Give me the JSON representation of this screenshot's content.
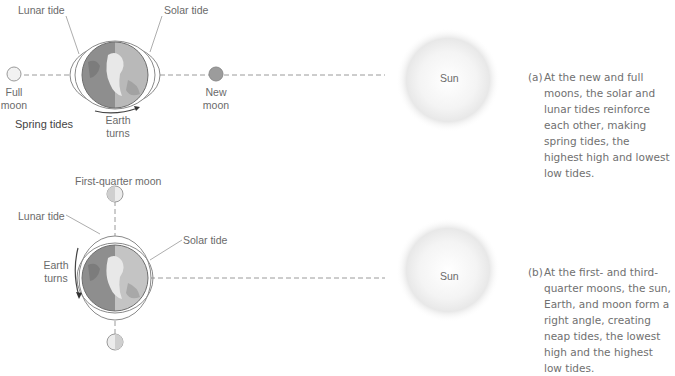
{
  "panel_a": {
    "labels": {
      "lunar_tide": "Lunar tide",
      "solar_tide": "Solar tide",
      "full_moon": [
        "Full",
        "moon"
      ],
      "new_moon": [
        "New",
        "moon"
      ],
      "spring_tides": "Spring tides",
      "earth_turns": [
        "Earth",
        "turns"
      ],
      "sun": "Sun"
    },
    "caption_tag": "(a)",
    "caption": "At the new and full moons, the solar and lunar tides reinforce each other, making spring tides, the highest high and lowest low tides."
  },
  "panel_b": {
    "labels": {
      "first_quarter_moon": "First-quarter moon",
      "lunar_tide": "Lunar tide",
      "solar_tide": "Solar tide",
      "earth_turns": [
        "Earth",
        "turns"
      ],
      "sun": "Sun"
    },
    "caption_tag": "(b)",
    "caption": "At the first- and third-quarter moons, the sun, Earth, and moon form a right angle, creating neap tides, the lowest high and the highest low tides."
  },
  "colors": {
    "line": "#9a9a9a",
    "earth_dark": "#8a8a8a",
    "earth_light": "#c8c8c8",
    "sun_glow": "#e4e4e4"
  }
}
